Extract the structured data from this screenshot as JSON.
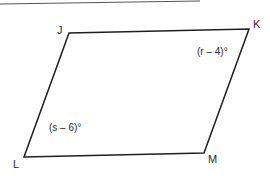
{
  "figure": {
    "type": "parallelogram",
    "vertices": [
      {
        "name": "J",
        "x": 69,
        "y": 33
      },
      {
        "name": "K",
        "x": 249,
        "y": 29
      },
      {
        "name": "M",
        "x": 204,
        "y": 153
      },
      {
        "name": "L",
        "x": 24,
        "y": 157
      }
    ],
    "labels": {
      "J": "J",
      "K": "K",
      "L": "L",
      "M": "M"
    },
    "angles": {
      "K": "(r – 4)°",
      "L": "(s – 6)°"
    },
    "colors": {
      "stroke": "#1e1e1e",
      "text": "#2a2a2a",
      "top_rule": "#555555"
    }
  }
}
